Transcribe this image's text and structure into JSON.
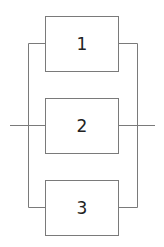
{
  "diagram": {
    "type": "parallel-system-block-diagram",
    "blocks": [
      {
        "id": "1",
        "label": "1"
      },
      {
        "id": "2",
        "label": "2"
      },
      {
        "id": "3",
        "label": "3"
      }
    ],
    "connections": [
      {
        "from": "input",
        "to": "1"
      },
      {
        "from": "input",
        "to": "2"
      },
      {
        "from": "input",
        "to": "3"
      },
      {
        "from": "1",
        "to": "output"
      },
      {
        "from": "2",
        "to": "output"
      },
      {
        "from": "3",
        "to": "output"
      }
    ],
    "colors": {
      "line": "#7a7a7a",
      "text": "#222222",
      "background": "#ffffff"
    }
  }
}
